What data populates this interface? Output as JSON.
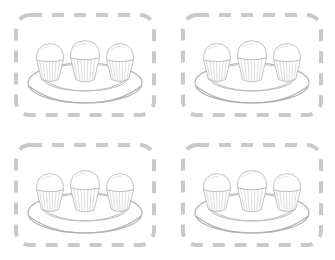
{
  "page": {
    "background_color": "#ffffff",
    "width": 335,
    "height": 260,
    "layout": "2x2-grid"
  },
  "style": {
    "dash_color": "#c9c9c9",
    "dash_width": 4,
    "dash_pattern": "12 10",
    "corner_radius": 14,
    "line_color": "#bfbfbf",
    "plate_line_color": "#b5b5b5",
    "cupcake_line_color": "#c4c4c4",
    "fill_color": "#ffffff"
  },
  "panels": [
    {
      "id": "panel-1",
      "position": "top-left",
      "x": 14,
      "y": 13,
      "width": 142,
      "height": 104,
      "item_count": 3,
      "item_name": "cupcake",
      "container_name": "plate"
    },
    {
      "id": "panel-2",
      "position": "top-right",
      "x": 181,
      "y": 13,
      "width": 142,
      "height": 104,
      "item_count": 3,
      "item_name": "cupcake",
      "container_name": "plate"
    },
    {
      "id": "panel-3",
      "position": "bottom-left",
      "x": 14,
      "y": 143,
      "width": 142,
      "height": 104,
      "item_count": 3,
      "item_name": "cupcake",
      "container_name": "plate"
    },
    {
      "id": "panel-4",
      "position": "bottom-right",
      "x": 181,
      "y": 143,
      "width": 142,
      "height": 104,
      "item_count": 3,
      "item_name": "cupcake",
      "container_name": "plate"
    }
  ],
  "artwork": {
    "description": "Line drawing of an oval plate holding three cupcakes",
    "plate": {
      "outer_ellipse": {
        "cx": 71,
        "cy": 64,
        "rx": 57,
        "ry": 20
      },
      "inner_ellipse": {
        "cx": 71,
        "cy": 59,
        "rx": 43,
        "ry": 13
      },
      "name": "oval-plate"
    },
    "cupcakes": [
      {
        "index": 1,
        "cx": 36,
        "cy": 42,
        "name": "cupcake-left"
      },
      {
        "index": 2,
        "cx": 71,
        "cy": 40,
        "name": "cupcake-center"
      },
      {
        "index": 3,
        "cx": 106,
        "cy": 42,
        "name": "cupcake-right"
      }
    ],
    "cupcake_parts": [
      "frosting-dome",
      "wrapper",
      "wrapper-ridges",
      "wrapper-top-rim"
    ]
  }
}
